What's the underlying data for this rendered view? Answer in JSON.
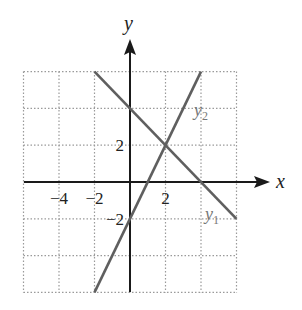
{
  "chart_data": {
    "type": "line",
    "title": "",
    "xlabel": "x",
    "ylabel": "y",
    "xlim": [
      -6,
      6
    ],
    "ylim": [
      -6,
      6
    ],
    "grid": true,
    "grid_step": 2,
    "x_tick_labels": [
      {
        "value": -4,
        "label": "−4"
      },
      {
        "value": -2,
        "label": "−2"
      },
      {
        "value": 2,
        "label": "2"
      }
    ],
    "y_tick_labels": [
      {
        "value": 2,
        "label": "2"
      },
      {
        "value": -2,
        "label": "−2"
      }
    ],
    "series": [
      {
        "name": "y1",
        "label_main": "y",
        "label_sub": "1",
        "equation": "y = -x + 4",
        "points": [
          [
            -2,
            6
          ],
          [
            6,
            -2
          ]
        ],
        "color": "#5f5f5f"
      },
      {
        "name": "y2",
        "label_main": "y",
        "label_sub": "2",
        "equation": "y = 2x - 2",
        "points": [
          [
            -2,
            -6
          ],
          [
            4,
            6
          ]
        ],
        "color": "#5f5f5f"
      }
    ],
    "intersection": [
      2,
      2
    ],
    "axis_color": "#1a1a1a",
    "grid_color": "#9a9a9a"
  }
}
